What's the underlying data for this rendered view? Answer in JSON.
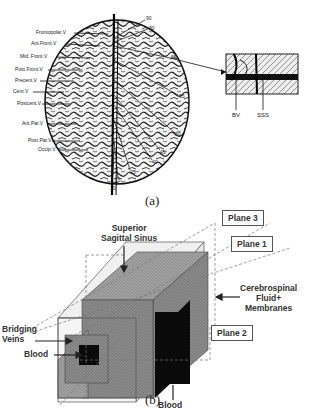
{
  "figure_a": {
    "caption": "(a)",
    "vein_labels": [
      "Frontopolar.V",
      "Ant.Front.V",
      "Mid. Front.V",
      "Post.Front.V",
      "Precent.V",
      "Cent.V",
      "Postcent.V",
      "Ant.Par.V",
      "Post.Par.V",
      "Occip.V"
    ],
    "angle_labels": [
      "90",
      "80",
      "65",
      "65",
      "50",
      "45",
      "40",
      "25",
      "15",
      "10"
    ],
    "inset_labels": {
      "bv": "BV",
      "sss": "SSS"
    }
  },
  "figure_b": {
    "caption": "(b)",
    "labels": {
      "superior_sagittal_sinus": "Superior\nSagittal Sinus",
      "plane3": "Plane 3",
      "plane1": "Plane 1",
      "plane2": "Plane 2",
      "csf": "Cerebrospinal\nFluid+\nMembranes",
      "bridging_veins": "Bridging\nVeins",
      "blood_left": "Blood",
      "blood_center": "Blood"
    },
    "colors": {
      "outer_box": "#ececec",
      "sinus_box": "#8a8a8a",
      "blood": "#0a0a0a",
      "vein_box": "#9a9a9a"
    }
  }
}
